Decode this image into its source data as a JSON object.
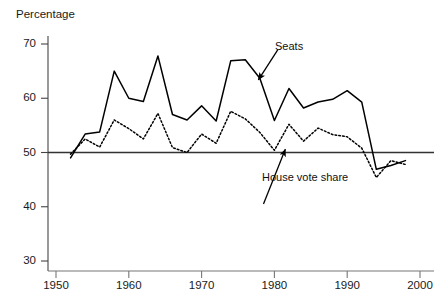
{
  "chart_data": {
    "type": "line",
    "title": "",
    "subtitle": "",
    "xlabel": "",
    "ylabel": "Percentage",
    "ylabel_position": "top-left",
    "xlim": [
      1950,
      2000
    ],
    "ylim": [
      30,
      70
    ],
    "grid": false,
    "legend": "none (inline annotations with arrows)",
    "xticks": [
      1950,
      1960,
      1970,
      1980,
      1990,
      2000
    ],
    "yticks": [
      30,
      40,
      50,
      60,
      70
    ],
    "xtick_labels": [
      "1950",
      "1960",
      "1970",
      "1980",
      "1990",
      "2000"
    ],
    "ytick_labels": [
      "30",
      "40",
      "50",
      "60",
      "70"
    ],
    "reference_line": {
      "name": "fifty-percent-line",
      "y": 50,
      "style": "solid",
      "color": "#333333"
    },
    "annotations": [
      {
        "name": "seats-annotation",
        "text": "Seats",
        "x_text": 1980.5,
        "y_text": 69.0,
        "x_point": 1977.8,
        "y_point": 63.4,
        "arrow": true
      },
      {
        "name": "house-vote-share-annotation",
        "text": "House vote share",
        "x_text": 1978.5,
        "y_text": 40.5,
        "x_point": 1981.5,
        "y_point": 50.6,
        "arrow": true
      }
    ],
    "x": [
      1952,
      1954,
      1956,
      1958,
      1960,
      1962,
      1964,
      1966,
      1968,
      1970,
      1972,
      1974,
      1976,
      1978,
      1980,
      1982,
      1984,
      1986,
      1988,
      1990,
      1992,
      1994,
      1996,
      1998
    ],
    "series": [
      {
        "name": "Seats",
        "style": "solid",
        "color": "#000000",
        "values": [
          49.0,
          53.4,
          53.8,
          65.0,
          60.0,
          59.4,
          67.8,
          57.0,
          56.0,
          58.6,
          55.8,
          66.9,
          67.1,
          63.7,
          55.9,
          61.8,
          58.2,
          59.3,
          59.8,
          61.4,
          59.3,
          46.9,
          47.6,
          48.5
        ]
      },
      {
        "name": "House vote share",
        "style": "dotted",
        "color": "#000000",
        "values": [
          49.7,
          52.5,
          51.0,
          56.0,
          54.4,
          52.5,
          57.2,
          50.9,
          50.0,
          53.4,
          51.7,
          57.6,
          56.2,
          53.7,
          50.4,
          55.2,
          52.1,
          54.5,
          53.3,
          52.9,
          50.8,
          45.4,
          48.5,
          47.8
        ]
      }
    ]
  }
}
